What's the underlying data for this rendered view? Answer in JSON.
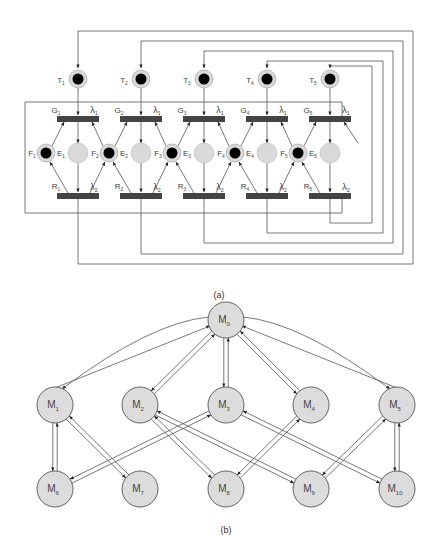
{
  "figure": {
    "part_a": {
      "caption": "(a)",
      "colors": {
        "line": "#555555",
        "bar": "#444444",
        "place_fill": "#d9d9d9",
        "token": "#000000"
      },
      "rate_labels": {
        "lambda1": "λ1",
        "lambda2": "λ2"
      },
      "stages": [
        {
          "T": "T1",
          "G": "G1",
          "F": "F1",
          "E": "E1",
          "R": "R1",
          "x": 78
        },
        {
          "T": "T2",
          "G": "G2",
          "F": "F2",
          "E": "E2",
          "R": "R2",
          "x": 141
        },
        {
          "T": "T3",
          "G": "G3",
          "F": "F3",
          "E": "E3",
          "R": "R3",
          "x": 204
        },
        {
          "T": "T4",
          "G": "G4",
          "F": "F4",
          "E": "E4",
          "R": "R4",
          "x": 267
        },
        {
          "T": "T5",
          "G": "G5",
          "F": "F5",
          "E": "E5",
          "R": "R5",
          "x": 330
        }
      ]
    },
    "part_b": {
      "caption": "(b)",
      "colors": {
        "node_fill": "#dcdcdc",
        "node_stroke": "#555555",
        "edge": "#555555"
      },
      "nodes": [
        {
          "id": "M0",
          "label": "M",
          "sub": "0",
          "x": 226,
          "y": 320
        },
        {
          "id": "M1",
          "label": "M",
          "sub": "1",
          "x": 55,
          "y": 405
        },
        {
          "id": "M2",
          "label": "M",
          "sub": "2",
          "x": 140,
          "y": 405
        },
        {
          "id": "M3",
          "label": "M",
          "sub": "3",
          "x": 226,
          "y": 405
        },
        {
          "id": "M4",
          "label": "M",
          "sub": "4",
          "x": 311,
          "y": 405
        },
        {
          "id": "M5",
          "label": "M",
          "sub": "5",
          "x": 397,
          "y": 405
        },
        {
          "id": "M6",
          "label": "M",
          "sub": "6",
          "x": 55,
          "y": 489
        },
        {
          "id": "M7",
          "label": "M",
          "sub": "7",
          "x": 140,
          "y": 489
        },
        {
          "id": "M8",
          "label": "M",
          "sub": "8",
          "x": 226,
          "y": 489
        },
        {
          "id": "M9",
          "label": "M",
          "sub": "9",
          "x": 311,
          "y": 489
        },
        {
          "id": "M10",
          "label": "M",
          "sub": "10",
          "x": 397,
          "y": 489
        }
      ],
      "edges": [
        {
          "a": "M0",
          "b": "M1",
          "curved": true
        },
        {
          "a": "M0",
          "b": "M2"
        },
        {
          "a": "M0",
          "b": "M3"
        },
        {
          "a": "M0",
          "b": "M4"
        },
        {
          "a": "M0",
          "b": "M5",
          "curved": true
        },
        {
          "a": "M1",
          "b": "M6"
        },
        {
          "a": "M1",
          "b": "M7"
        },
        {
          "a": "M2",
          "b": "M8"
        },
        {
          "a": "M2",
          "b": "M9"
        },
        {
          "a": "M3",
          "b": "M6"
        },
        {
          "a": "M3",
          "b": "M10"
        },
        {
          "a": "M4",
          "b": "M8"
        },
        {
          "a": "M5",
          "b": "M9"
        },
        {
          "a": "M5",
          "b": "M10"
        }
      ]
    }
  }
}
